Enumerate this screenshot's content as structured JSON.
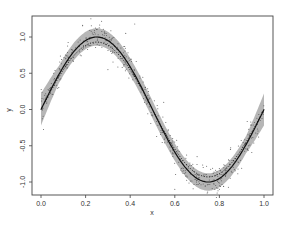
{
  "chart_data": {
    "type": "line",
    "title": "",
    "xlabel": "x",
    "ylabel": "y",
    "xlim": [
      -0.04,
      1.04
    ],
    "ylim": [
      -1.3,
      1.3
    ],
    "grid": false,
    "legend": null,
    "x_ticks": [
      0.0,
      0.2,
      0.4,
      0.6,
      0.8,
      1.0
    ],
    "x_tick_labels": [
      "0.0",
      "0.2",
      "0.4",
      "0.6",
      "0.8",
      "1.0"
    ],
    "y_ticks": [
      -1.0,
      -0.5,
      0.0,
      0.5,
      1.0
    ],
    "y_tick_labels": [
      "-1.0",
      "-0.5",
      "0.0",
      "0.5",
      "1.0"
    ],
    "series": [
      {
        "name": "fitted curve",
        "style": "solid",
        "function": "sin(2*pi*x)",
        "x": [
          0.0,
          0.05,
          0.1,
          0.15,
          0.2,
          0.25,
          0.3,
          0.35,
          0.4,
          0.45,
          0.5,
          0.55,
          0.6,
          0.65,
          0.7,
          0.75,
          0.8,
          0.85,
          0.9,
          0.95,
          1.0
        ],
        "y": [
          0.0,
          0.31,
          0.59,
          0.81,
          0.95,
          1.0,
          0.95,
          0.81,
          0.59,
          0.31,
          0.0,
          -0.31,
          -0.59,
          -0.81,
          -0.95,
          -1.0,
          -0.95,
          -0.81,
          -0.59,
          -0.31,
          0.0
        ]
      },
      {
        "name": "true curve",
        "style": "dotted",
        "function": "0.95*sin(2*pi*x)"
      },
      {
        "name": "confidence band",
        "style": "shaded",
        "half_width": 0.12,
        "half_width_at_ends": 0.22
      },
      {
        "name": "observations",
        "style": "points",
        "noise_sd": 0.1
      }
    ]
  },
  "axes": {
    "x_label": "x",
    "y_label": "y"
  }
}
